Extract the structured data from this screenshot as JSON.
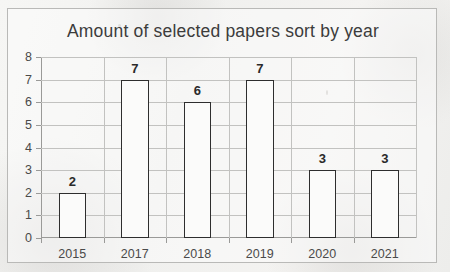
{
  "chart_data": {
    "type": "bar",
    "title": "Amount of selected papers sort by year",
    "categories": [
      "2015",
      "2017",
      "2018",
      "2019",
      "2020",
      "2021"
    ],
    "values": [
      2,
      7,
      6,
      7,
      3,
      3
    ],
    "xlabel": "",
    "ylabel": "",
    "ylim": [
      0,
      8
    ],
    "yticks": [
      "0",
      "1",
      "2",
      "3",
      "4",
      "5",
      "6",
      "7",
      "8"
    ],
    "grid": true,
    "legend": false,
    "data_labels": [
      "2",
      "7",
      "6",
      "7",
      "3",
      "3"
    ],
    "bar_fill_color": "#fbfbfa",
    "bar_edge_color": "#2e2e2e",
    "grid_color": "#c2c2c0",
    "axis_color": "#9a9a98",
    "title_color": "#3c3c3c",
    "background_color": "#f2f2f0"
  }
}
